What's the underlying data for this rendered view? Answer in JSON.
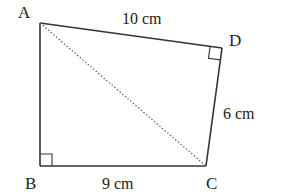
{
  "diagram": {
    "type": "quadrilateral",
    "vertices": {
      "A": {
        "label": "A",
        "x": 40,
        "y": 23
      },
      "B": {
        "label": "B",
        "x": 40,
        "y": 166
      },
      "C": {
        "label": "C",
        "x": 206,
        "y": 166
      },
      "D": {
        "label": "D",
        "x": 222,
        "y": 48
      }
    },
    "sides": {
      "AD": {
        "label": "10 cm"
      },
      "DC": {
        "label": "6 cm"
      },
      "BC": {
        "label": "9 cm"
      }
    },
    "diagonal": {
      "from": "A",
      "to": "C",
      "style": "dotted"
    },
    "right_angles": [
      "B",
      "D"
    ],
    "colors": {
      "stroke": "#333333",
      "text": "#222222",
      "background": "#ffffff"
    }
  }
}
